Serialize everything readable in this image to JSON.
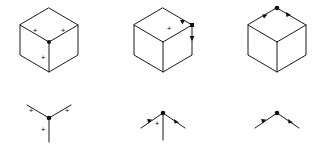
{
  "figure": {
    "type": "line-drawing-junction-labeling",
    "title": "",
    "background_color": "#ffffff",
    "line_color": "#1a1a1a",
    "mark_color": "#111111",
    "plus_symbol": "+",
    "columns": 3,
    "rows": 2
  },
  "cubes": [
    {
      "id": "cube-1",
      "name": "cube-convex-y-junction",
      "center_x": 49,
      "center_y": 42,
      "half_width": 29,
      "top_height": 17,
      "side_height": 30,
      "internal_vertex_dot": true,
      "edge_labels": [
        {
          "edge": "internal-top-left",
          "symbol": "+",
          "x": 35,
          "y": 30
        },
        {
          "edge": "internal-top-right",
          "symbol": "+",
          "x": 63,
          "y": 30
        },
        {
          "edge": "internal-vertical",
          "symbol": "+",
          "x": 43,
          "y": 58
        }
      ],
      "arrows": []
    },
    {
      "id": "cube-2",
      "name": "cube-arrow-junction-mixed",
      "center_x": 163,
      "center_y": 42,
      "half_width": 29,
      "top_height": 17,
      "side_height": 30,
      "internal_vertex_dot": false,
      "edge_labels": [
        {
          "edge": "internal-top",
          "symbol": "+",
          "x": 168,
          "y": 28
        }
      ],
      "arrows": [
        {
          "edge": "top-right-outer",
          "direction": "toward-top-right-vertex"
        },
        {
          "edge": "right-vertical-outer",
          "direction": "downward"
        }
      ],
      "vertex_dots": [
        {
          "x": 192,
          "y": 25
        }
      ]
    },
    {
      "id": "cube-3",
      "name": "cube-arrow-junction-occluding",
      "center_x": 277,
      "center_y": 42,
      "half_width": 29,
      "top_height": 17,
      "side_height": 30,
      "internal_vertex_dot": false,
      "edge_labels": [],
      "arrows": [
        {
          "edge": "top-left-outer",
          "direction": "away-from-apex-left"
        },
        {
          "edge": "top-right-outer",
          "direction": "away-from-apex-right"
        }
      ],
      "vertex_dots": [
        {
          "x": 277,
          "y": 8
        }
      ]
    }
  ],
  "junctions": [
    {
      "id": "junction-1",
      "name": "y-junction-all-convex",
      "junction_type": "Y",
      "apex_x": 49,
      "apex_y": 118,
      "center_dot": true,
      "legs": [
        {
          "leg": "upper-left",
          "end_x": 27,
          "end_y": 105,
          "mark": "+",
          "mark_x": 31,
          "mark_y": 110
        },
        {
          "leg": "upper-right",
          "end_x": 71,
          "end_y": 105,
          "mark": "+",
          "mark_x": 67,
          "mark_y": 110
        },
        {
          "leg": "down",
          "end_x": 49,
          "end_y": 142,
          "mark": "+",
          "mark_x": 43,
          "mark_y": 130
        }
      ]
    },
    {
      "id": "junction-2",
      "name": "arrow-junction-with-convex-stem",
      "junction_type": "arrow",
      "apex_x": 163,
      "apex_y": 113,
      "center_dot": true,
      "legs": [
        {
          "leg": "lower-left",
          "end_x": 141,
          "end_y": 128,
          "mark": "arrow",
          "arrow_direction": "toward-apex"
        },
        {
          "leg": "lower-right",
          "end_x": 185,
          "end_y": 128,
          "mark": "arrow",
          "arrow_direction": "toward-apex"
        },
        {
          "leg": "down",
          "end_x": 163,
          "end_y": 140,
          "mark": "+",
          "mark_x": 157,
          "mark_y": 124
        }
      ]
    },
    {
      "id": "junction-3",
      "name": "arrow-junction-occluding-only",
      "junction_type": "arrow",
      "apex_x": 277,
      "apex_y": 113,
      "center_dot": true,
      "legs": [
        {
          "leg": "lower-left",
          "end_x": 255,
          "end_y": 128,
          "mark": "arrow",
          "arrow_direction": "toward-apex"
        },
        {
          "leg": "lower-right",
          "end_x": 299,
          "end_y": 128,
          "mark": "arrow",
          "arrow_direction": "toward-apex"
        }
      ]
    }
  ]
}
